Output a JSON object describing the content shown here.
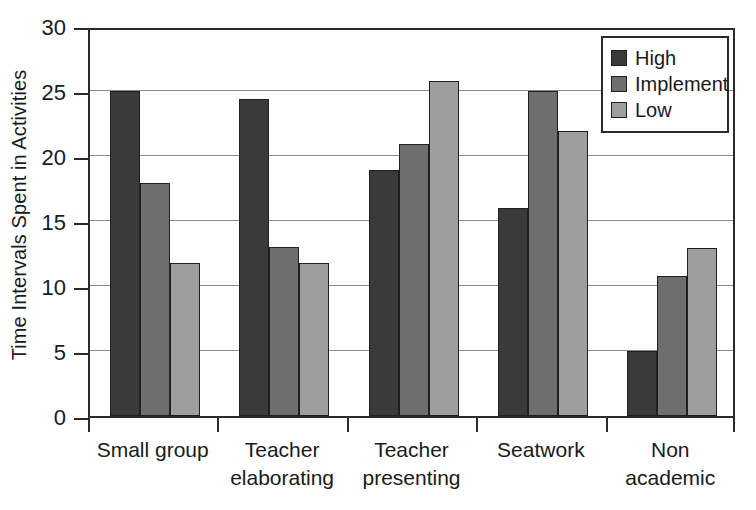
{
  "chart_data": {
    "type": "bar",
    "title": "",
    "xlabel": "",
    "ylabel": "Time Intervals Spent in Activities",
    "ylim": [
      0,
      30
    ],
    "yticks": [
      0,
      5,
      10,
      15,
      20,
      25,
      30
    ],
    "grid": true,
    "legend_position": "top-right",
    "categories": [
      "Small group",
      "Teacher elaborating",
      "Teacher presenting",
      "Seatwork",
      "Non academic"
    ],
    "category_lines": [
      [
        "Small group",
        ""
      ],
      [
        "Teacher",
        "elaborating"
      ],
      [
        "Teacher",
        "presenting"
      ],
      [
        "Seatwork",
        ""
      ],
      [
        "Non",
        "academic"
      ]
    ],
    "series": [
      {
        "name": "High",
        "color": "#3a3a3a",
        "values": [
          25.0,
          24.4,
          18.9,
          16.0,
          5.0
        ]
      },
      {
        "name": "Implement",
        "color": "#6e6e6e",
        "values": [
          17.9,
          13.0,
          20.9,
          25.0,
          10.8
        ]
      },
      {
        "name": "Low",
        "color": "#9e9e9e",
        "values": [
          11.8,
          11.8,
          25.8,
          21.9,
          12.9
        ]
      }
    ]
  },
  "legend": {
    "items": [
      {
        "label": "High"
      },
      {
        "label": "Implement"
      },
      {
        "label": "Low"
      }
    ]
  },
  "axes": {
    "y_title": "Time Intervals Spent in Activities",
    "y_tick_labels": [
      "30",
      "25",
      "20",
      "15",
      "10",
      "5",
      "0"
    ]
  }
}
